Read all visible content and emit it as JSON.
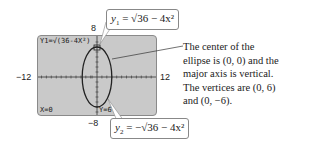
{
  "calculator": {
    "equation_display": "Y1=√(36-4X²)",
    "cursor_x": "X=0",
    "cursor_y": "Y=6",
    "window": {
      "xmin": "−12",
      "xmax": "12",
      "ymin": "−8",
      "ymax": "8"
    }
  },
  "callouts": {
    "top_formula": {
      "lhs": "y",
      "sub": "1",
      "rhs": "= √36 − 4x²"
    },
    "bottom_formula": {
      "lhs": "y",
      "sub": "2",
      "rhs": "= −√36 − 4x²"
    }
  },
  "description": {
    "lines": [
      "The center of the",
      "ellipse is (0, 0) and the",
      "major axis is vertical.",
      "The vertices are (0, 6)",
      "and (0, −6)."
    ]
  },
  "colors": {
    "screen": "#c9c9c9",
    "curve": "#222222",
    "box_border": "#888888"
  }
}
